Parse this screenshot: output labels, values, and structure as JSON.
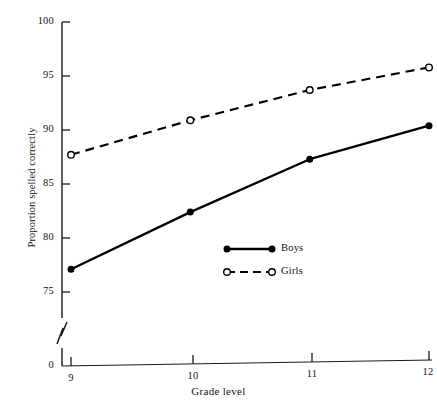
{
  "chart_data": {
    "type": "line",
    "title": "",
    "xlabel": "Grade level",
    "ylabel": "Proportion spelled correctly",
    "categories": [
      "9",
      "10",
      "11",
      "12"
    ],
    "x": [
      9,
      10,
      11,
      12
    ],
    "xlim": [
      8.6,
      12.3
    ],
    "ylim": [
      75,
      100
    ],
    "y_axis_break": true,
    "y_break_label": "0",
    "grid": false,
    "legend_position": "center",
    "yticks": [
      75,
      80,
      85,
      90,
      95,
      100
    ],
    "ytick_labels": [
      "75",
      "80",
      "85",
      "90",
      "95",
      "100"
    ],
    "xtick_labels": [
      "9",
      "10",
      "11",
      "12"
    ],
    "series": [
      {
        "name": "Boys",
        "marker": "filled-circle",
        "linestyle": "solid",
        "color": "#000000",
        "values": [
          77.1,
          82.4,
          87.3,
          90.4
        ]
      },
      {
        "name": "Girls",
        "marker": "open-circle",
        "linestyle": "dashed",
        "color": "#000000",
        "values": [
          87.7,
          90.9,
          93.7,
          95.8
        ]
      }
    ]
  },
  "axes": {
    "y_title": "Proportion spelled correctly",
    "x_title": "Grade level",
    "y_zero_label": "0",
    "y_labels": [
      "100",
      "95",
      "90",
      "85",
      "80",
      "75"
    ],
    "x_labels": [
      "9",
      "10",
      "11",
      "12"
    ]
  },
  "legend": {
    "entries": [
      {
        "label": "Boys",
        "marker": "filled-circle",
        "linestyle": "solid"
      },
      {
        "label": "Girls",
        "marker": "open-circle",
        "linestyle": "dashed"
      }
    ]
  },
  "colors": {
    "ink": "#141414",
    "line": "#000000",
    "background": "#ffffff"
  }
}
